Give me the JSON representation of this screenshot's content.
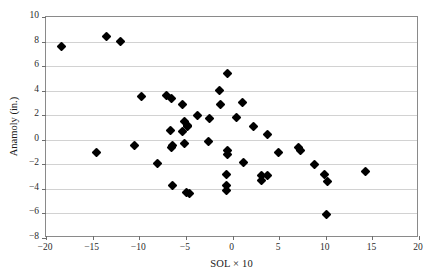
{
  "chart_data": {
    "type": "scatter",
    "title": "",
    "xlabel": "SOL × 10",
    "ylabel": "Anamoly (in.)",
    "xlim": [
      -20,
      20
    ],
    "ylim": [
      -8,
      10
    ],
    "xticks": [
      -20,
      -15,
      -10,
      -5,
      0,
      5,
      10,
      15,
      20
    ],
    "xtick_labels": [
      "−20",
      "−15",
      "−10",
      "−5",
      "0",
      "5",
      "10",
      "15",
      "20"
    ],
    "yticks": [
      -8,
      -6,
      -4,
      -2,
      0,
      2,
      4,
      6,
      8,
      10
    ],
    "ytick_labels": [
      "−8",
      "−6",
      "−4",
      "−2",
      "0",
      "2",
      "4",
      "6",
      "8",
      "10"
    ],
    "grid": "horizontal",
    "legend": "none",
    "marker": "diamond",
    "marker_color": "#000000",
    "series": [
      {
        "name": "anomaly",
        "points": [
          [
            -18.3,
            7.6
          ],
          [
            -13.5,
            8.4
          ],
          [
            -12.0,
            8.0
          ],
          [
            -14.6,
            -1.0
          ],
          [
            -10.5,
            -0.45
          ],
          [
            -9.8,
            3.55
          ],
          [
            -8.0,
            -1.95
          ],
          [
            -7.1,
            3.6
          ],
          [
            -6.5,
            3.4
          ],
          [
            -6.6,
            0.75
          ],
          [
            -6.4,
            -0.5
          ],
          [
            -6.5,
            -0.6
          ],
          [
            -6.4,
            -3.75
          ],
          [
            -5.4,
            2.85
          ],
          [
            -5.1,
            1.5
          ],
          [
            -5.4,
            0.7
          ],
          [
            -4.8,
            1.2
          ],
          [
            -4.8,
            1.1
          ],
          [
            -5.1,
            -0.3
          ],
          [
            -4.9,
            -4.3
          ],
          [
            -4.6,
            -4.4
          ],
          [
            -3.8,
            1.95
          ],
          [
            -2.5,
            1.75
          ],
          [
            -2.6,
            -0.15
          ],
          [
            -1.4,
            4.05
          ],
          [
            -1.3,
            2.9
          ],
          [
            -0.5,
            5.4
          ],
          [
            -0.5,
            -0.9
          ],
          [
            -0.5,
            -1.2
          ],
          [
            -0.6,
            -2.8
          ],
          [
            -0.6,
            -3.75
          ],
          [
            -0.6,
            -4.15
          ],
          [
            0.4,
            1.85
          ],
          [
            1.1,
            3.05
          ],
          [
            1.2,
            -1.85
          ],
          [
            2.2,
            1.05
          ],
          [
            3.1,
            -2.95
          ],
          [
            3.1,
            -3.3
          ],
          [
            3.7,
            -2.9
          ],
          [
            3.8,
            0.4
          ],
          [
            4.9,
            -1.0
          ],
          [
            7.1,
            -0.65
          ],
          [
            7.3,
            -0.85
          ],
          [
            8.8,
            -2.05
          ],
          [
            9.9,
            -2.8
          ],
          [
            10.2,
            -3.4
          ],
          [
            10.1,
            -6.05
          ],
          [
            14.3,
            -2.55
          ]
        ]
      }
    ]
  }
}
